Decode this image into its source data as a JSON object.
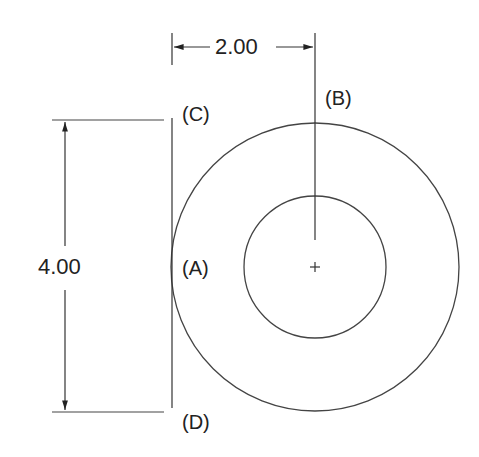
{
  "diagram": {
    "dimensions": {
      "horizontal": "2.00",
      "vertical": "4.00"
    },
    "points": {
      "a": "(A)",
      "b": "(B)",
      "c": "(C)",
      "d": "(D)"
    },
    "colors": {
      "line": "#333333",
      "text": "#222222",
      "background": "#ffffff"
    }
  }
}
